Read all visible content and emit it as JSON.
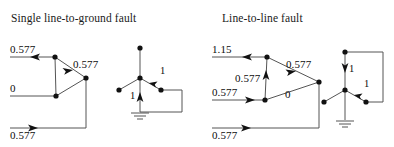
{
  "figures": [
    {
      "title": "Single line-to-ground fault",
      "phasor": {
        "labels": {
          "top_left": "0.577",
          "upper_right": "0.577",
          "middle_left": "0",
          "bottom_left": "0.577"
        }
      },
      "circuit": {
        "labels": {
          "right_branch": "1",
          "center_branch": "1"
        }
      }
    },
    {
      "title": "Line-to-line fault",
      "phasor": {
        "labels": {
          "top_left": "1.15",
          "upper_right": "0.577",
          "vertical": "0.577",
          "middle_left": "0.577",
          "inner_right": "0",
          "bottom_left": "0.577"
        }
      },
      "circuit": {
        "labels": {
          "upper_branch": "1",
          "right_branch": "1"
        }
      }
    }
  ],
  "colors": {
    "ink": "#0d0d0d",
    "line": "#4a4a4a",
    "background": "#ffffff"
  }
}
